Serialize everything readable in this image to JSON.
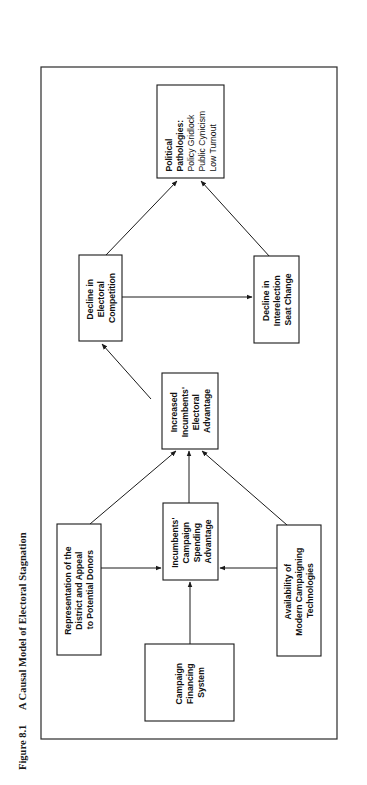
{
  "caption": {
    "figure_label": "Figure 8.1",
    "title": "A Causal Model of Electoral Stagnation"
  },
  "nodes": {
    "campaign_financing": {
      "lines": [
        "Campaign",
        "Financing",
        "System"
      ]
    },
    "representation": {
      "lines": [
        "Representation of the",
        "District and Appeal",
        "to Potential Donors"
      ]
    },
    "availability": {
      "lines": [
        "Availability of",
        "Modern Campaigning",
        "Technologies"
      ]
    },
    "spending_advantage": {
      "lines": [
        "Incumbents'",
        "Campaign",
        "Spending",
        "Advantage"
      ]
    },
    "electoral_advantage": {
      "lines": [
        "Increased",
        "Incumbents'",
        "Electoral",
        "Advantage"
      ]
    },
    "decline_competition": {
      "lines": [
        "Decline in",
        "Electoral",
        "Competition"
      ]
    },
    "decline_seat_change": {
      "lines": [
        "Decline in",
        "Interelection",
        "Seat Change"
      ]
    },
    "pathologies": {
      "heading": [
        "Political",
        "Pathologies:"
      ],
      "items": [
        "Policy Gridlock",
        "Public Cynicism",
        "Low Turnout"
      ]
    }
  },
  "edges": [
    {
      "from": "campaign_financing",
      "to": "spending_advantage"
    },
    {
      "from": "representation",
      "to": "spending_advantage"
    },
    {
      "from": "availability",
      "to": "spending_advantage"
    },
    {
      "from": "representation",
      "to": "electoral_advantage"
    },
    {
      "from": "spending_advantage",
      "to": "electoral_advantage"
    },
    {
      "from": "availability",
      "to": "electoral_advantage"
    },
    {
      "from": "electoral_advantage",
      "to": "decline_competition"
    },
    {
      "from": "decline_competition",
      "to": "decline_seat_change"
    },
    {
      "from": "decline_competition",
      "to": "pathologies"
    },
    {
      "from": "decline_seat_change",
      "to": "pathologies"
    }
  ],
  "orientation": "rotated 90 degrees counter-clockwise"
}
